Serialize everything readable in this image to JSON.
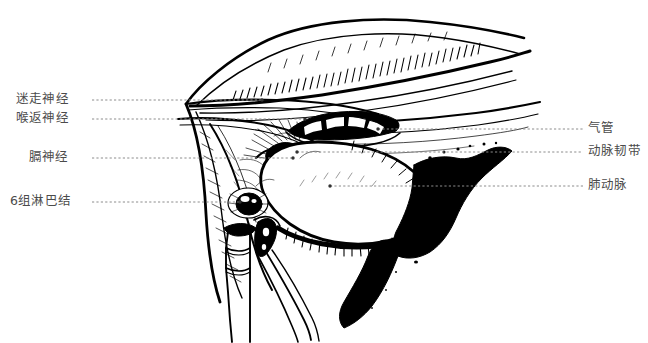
{
  "figure": {
    "type": "medical-anatomical-line-illustration",
    "background_color": "#ffffff",
    "ink_color": "#000000",
    "label_text_color": "#4b4b4b",
    "leader_line_color": "#8c8c8c",
    "canvas": {
      "width": 648,
      "height": 343
    }
  },
  "labels": {
    "left": [
      {
        "id": "vagus-nerve",
        "text": "迷走神经",
        "text_x": 16,
        "text_y": 100,
        "leader_from_x": 92,
        "leader_to_x": 262,
        "leader_y": 100,
        "dot_x": 262
      },
      {
        "id": "recurrent-laryngeal",
        "text": "喉返神经",
        "text_x": 16,
        "text_y": 119,
        "leader_from_x": 92,
        "leader_to_x": 305,
        "leader_y": 119,
        "dot_x": 305
      },
      {
        "id": "phrenic-nerve",
        "text": "膈神经",
        "text_x": 29,
        "text_y": 158,
        "leader_from_x": 92,
        "leader_to_x": 293,
        "leader_y": 158,
        "dot_x": 293
      },
      {
        "id": "group-6-lymph-nodes",
        "text": "6组淋巴结",
        "text_x": 10,
        "text_y": 202,
        "leader_from_x": 92,
        "leader_to_x": 240,
        "leader_y": 202,
        "dot_x": 240
      }
    ],
    "right": [
      {
        "id": "trachea",
        "text": "气管",
        "text_x": 588,
        "text_y": 129,
        "leader_from_x": 378,
        "leader_to_x": 583,
        "leader_y": 129,
        "dot_x": 378
      },
      {
        "id": "ligamentum-arteriosum",
        "text": "动脉韧带",
        "text_x": 588,
        "text_y": 152,
        "leader_from_x": 297,
        "leader_to_x": 583,
        "leader_y": 152,
        "dot_x": 297
      },
      {
        "id": "pulmonary-artery",
        "text": "肺动脉",
        "text_x": 588,
        "text_y": 186,
        "leader_from_x": 330,
        "leader_to_x": 583,
        "leader_y": 186,
        "dot_x": 330
      }
    ]
  },
  "structures": [
    {
      "id": "upper-lung-pleura",
      "name": "上方肺/胸膜缘"
    },
    {
      "id": "trachea-cartilage",
      "name": "气管软骨环"
    },
    {
      "id": "pulmonary-artery-mass",
      "name": "肺动脉"
    },
    {
      "id": "lymph-node",
      "name": "淋巴结"
    },
    {
      "id": "surgical-clip",
      "name": "血管夹"
    },
    {
      "id": "forceps",
      "name": "分离钳"
    }
  ]
}
